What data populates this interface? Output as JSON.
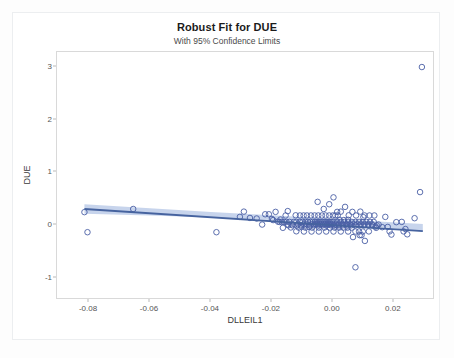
{
  "figure": {
    "title": "Robust Fit for DUE",
    "subtitle": "With 95% Confidence Limits"
  },
  "chart_data": {
    "type": "scatter",
    "title": "Robust Fit for DUE",
    "subtitle": "With 95% Confidence Limits",
    "xlabel": "DLLEIL1",
    "ylabel": "DUE",
    "xlim": [
      -0.0905,
      0.0335
    ],
    "ylim": [
      -1.42,
      3.28
    ],
    "xticks": [
      -0.08,
      -0.06,
      -0.04,
      -0.02,
      0.0,
      0.02
    ],
    "xticklabels": [
      "-0.08",
      "-0.06",
      "-0.04",
      "-0.02",
      "0.00",
      "0.02"
    ],
    "yticks": [
      -1,
      0,
      1,
      2,
      3
    ],
    "yticklabels": [
      "-1",
      "0",
      "1",
      "2",
      "3"
    ],
    "grid": false,
    "legend": false,
    "marker": {
      "shape": "open-circle",
      "color": "#4a5fa5",
      "size": 4
    },
    "fit_line": {
      "name": "Robust fit",
      "color": "#46639f",
      "x": [
        -0.0815,
        0.0295
      ],
      "y": [
        0.305,
        -0.115
      ]
    },
    "confidence_band": {
      "name": "95% Confidence Limits",
      "level": 0.95,
      "color": "#b4c6e6",
      "x": [
        -0.0815,
        -0.06,
        -0.04,
        -0.02,
        0.0,
        0.015,
        0.0295
      ],
      "upper": [
        0.395,
        0.318,
        0.25,
        0.186,
        0.122,
        0.07,
        0.018
      ],
      "lower": [
        0.215,
        0.18,
        0.142,
        0.098,
        0.04,
        -0.03,
        -0.12
      ]
    },
    "points": [
      [
        -0.0815,
        0.245
      ],
      [
        -0.0805,
        -0.135
      ],
      [
        -0.0655,
        0.305
      ],
      [
        -0.0382,
        -0.135
      ],
      [
        -0.0305,
        0.155
      ],
      [
        -0.0292,
        0.255
      ],
      [
        -0.0272,
        0.135
      ],
      [
        -0.025,
        0.125
      ],
      [
        -0.0232,
        0.01
      ],
      [
        -0.0222,
        0.205
      ],
      [
        -0.021,
        0.205
      ],
      [
        -0.02,
        0.115
      ],
      [
        -0.0196,
        0.095
      ],
      [
        -0.0188,
        0.25
      ],
      [
        -0.018,
        0.065
      ],
      [
        -0.0175,
        0.06
      ],
      [
        -0.0168,
        0.06
      ],
      [
        -0.016,
        0.06
      ],
      [
        -0.0152,
        0.06
      ],
      [
        -0.0148,
        0.01
      ],
      [
        -0.0142,
        0.06
      ],
      [
        -0.0135,
        0.015
      ],
      [
        -0.0128,
        0.06
      ],
      [
        -0.012,
        0.06
      ],
      [
        -0.0114,
        0.015
      ],
      [
        -0.0108,
        0.06
      ],
      [
        -0.0104,
        -0.03
      ],
      [
        -0.01,
        0.06
      ],
      [
        -0.0095,
        0.015
      ],
      [
        -0.009,
        0.06
      ],
      [
        -0.0086,
        0.015
      ],
      [
        -0.0082,
        0.06
      ],
      [
        -0.0078,
        -0.035
      ],
      [
        -0.0074,
        0.06
      ],
      [
        -0.007,
        0.015
      ],
      [
        -0.0066,
        0.06
      ],
      [
        -0.0062,
        0.015
      ],
      [
        -0.0058,
        0.06
      ],
      [
        -0.0055,
        0.015
      ],
      [
        -0.0052,
        0.06
      ],
      [
        -0.0049,
        0.015
      ],
      [
        -0.0046,
        0.06
      ],
      [
        -0.0043,
        0.015
      ],
      [
        -0.004,
        0.06
      ],
      [
        -0.0037,
        0.015
      ],
      [
        -0.0034,
        0.06
      ],
      [
        -0.0031,
        0.015
      ],
      [
        -0.0028,
        0.06
      ],
      [
        -0.0025,
        0.015
      ],
      [
        -0.0022,
        0.06
      ],
      [
        -0.0019,
        0.015
      ],
      [
        -0.0016,
        0.06
      ],
      [
        -0.0013,
        0.015
      ],
      [
        -0.001,
        0.06
      ],
      [
        -0.0007,
        0.015
      ],
      [
        -0.0004,
        0.06
      ],
      [
        -0.0001,
        0.015
      ],
      [
        -0.0148,
        0.265
      ],
      [
        -0.0122,
        0.185
      ],
      [
        -0.0108,
        0.182
      ],
      [
        -0.0096,
        0.182
      ],
      [
        -0.0085,
        0.182
      ],
      [
        -0.0072,
        0.182
      ],
      [
        -0.006,
        0.182
      ],
      [
        -0.0048,
        0.182
      ],
      [
        -0.0036,
        0.182
      ],
      [
        -0.0024,
        0.182
      ],
      [
        -0.0012,
        0.182
      ],
      [
        0.0,
        0.182
      ],
      [
        0.0008,
        0.182
      ],
      [
        0.0016,
        0.182
      ],
      [
        -0.0138,
        -0.045
      ],
      [
        -0.0112,
        -0.048
      ],
      [
        -0.009,
        -0.048
      ],
      [
        -0.0068,
        -0.048
      ],
      [
        -0.0046,
        -0.048
      ],
      [
        -0.0028,
        -0.048
      ],
      [
        -0.001,
        -0.048
      ],
      [
        0.0006,
        -0.048
      ],
      [
        0.002,
        -0.048
      ],
      [
        0.0034,
        -0.048
      ],
      [
        0.0048,
        -0.048
      ],
      [
        0.0062,
        -0.048
      ],
      [
        -0.012,
        -0.118
      ],
      [
        -0.0095,
        -0.122
      ],
      [
        -0.007,
        -0.122
      ],
      [
        -0.0046,
        -0.122
      ],
      [
        -0.0022,
        -0.122
      ],
      [
        0.0002,
        -0.122
      ],
      [
        0.0026,
        -0.122
      ],
      [
        0.005,
        -0.122
      ],
      [
        0.0074,
        -0.122
      ],
      [
        -0.005,
        0.44
      ],
      [
        -0.003,
        0.305
      ],
      [
        -0.0012,
        0.395
      ],
      [
        0.0002,
        0.525
      ],
      [
        0.0014,
        0.25
      ],
      [
        0.0026,
        0.255
      ],
      [
        0.004,
        0.345
      ],
      [
        0.0052,
        0.185
      ],
      [
        0.0064,
        0.25
      ],
      [
        0.0076,
        0.182
      ],
      [
        0.009,
        0.255
      ],
      [
        0.01,
        0.15
      ],
      [
        0.0002,
        0.06
      ],
      [
        0.0008,
        0.015
      ],
      [
        0.0014,
        0.06
      ],
      [
        0.002,
        0.015
      ],
      [
        0.0026,
        0.06
      ],
      [
        0.0032,
        0.015
      ],
      [
        0.0038,
        0.06
      ],
      [
        0.0044,
        0.015
      ],
      [
        0.005,
        0.06
      ],
      [
        0.0056,
        0.015
      ],
      [
        0.0062,
        0.06
      ],
      [
        0.0068,
        0.015
      ],
      [
        0.0074,
        0.06
      ],
      [
        0.008,
        0.015
      ],
      [
        0.0086,
        0.06
      ],
      [
        0.0092,
        0.015
      ],
      [
        0.0098,
        0.06
      ],
      [
        0.0104,
        0.015
      ],
      [
        0.011,
        0.06
      ],
      [
        0.0116,
        0.015
      ],
      [
        0.0122,
        0.06
      ],
      [
        0.0128,
        0.015
      ],
      [
        0.0134,
        0.06
      ],
      [
        0.014,
        -0.03
      ],
      [
        0.0088,
        -0.192
      ],
      [
        0.0094,
        -0.19
      ],
      [
        0.0066,
        -0.228
      ],
      [
        0.0142,
        -0.052
      ],
      [
        0.015,
        0.01
      ],
      [
        0.0162,
        -0.04
      ],
      [
        0.0172,
        0.155
      ],
      [
        0.018,
        -0.035
      ],
      [
        0.0186,
        -0.12
      ],
      [
        0.0192,
        -0.18
      ],
      [
        0.0074,
        -0.8
      ],
      [
        0.0105,
        -0.3
      ],
      [
        0.0208,
        0.055
      ],
      [
        0.0226,
        0.06
      ],
      [
        0.0238,
        -0.075
      ],
      [
        0.0232,
        -0.12
      ],
      [
        0.0244,
        -0.175
      ],
      [
        0.0268,
        0.13
      ],
      [
        0.0286,
        0.625
      ],
      [
        0.0292,
        2.995
      ],
      [
        0.005,
        0.1
      ],
      [
        0.0036,
        0.095
      ],
      [
        0.0022,
        0.1
      ],
      [
        0.0012,
        -0.005
      ],
      [
        -0.0006,
        -0.005
      ],
      [
        -0.002,
        -0.005
      ],
      [
        -0.0034,
        -0.005
      ],
      [
        -0.0048,
        -0.005
      ],
      [
        -0.0062,
        -0.005
      ],
      [
        -0.0076,
        -0.005
      ],
      [
        -0.009,
        -0.005
      ],
      [
        -0.0104,
        -0.005
      ],
      [
        -0.0118,
        -0.005
      ],
      [
        -0.0132,
        -0.005
      ],
      [
        -0.0146,
        -0.005
      ],
      [
        0.0004,
        -0.005
      ],
      [
        0.0018,
        -0.005
      ],
      [
        0.0032,
        -0.005
      ],
      [
        0.0046,
        -0.005
      ],
      [
        0.006,
        -0.005
      ],
      [
        0.0074,
        -0.005
      ],
      [
        0.0088,
        -0.005
      ],
      [
        0.0102,
        -0.005
      ],
      [
        0.0116,
        -0.005
      ],
      [
        0.013,
        -0.005
      ],
      [
        0.0144,
        -0.005
      ],
      [
        0.0136,
        0.182
      ],
      [
        0.012,
        0.182
      ],
      [
        0.0104,
        0.182
      ],
      [
        -0.0164,
        -0.052
      ],
      [
        -0.0155,
        0.182
      ],
      [
        -0.0172,
        0.105
      ],
      [
        0.0118,
        -0.12
      ],
      [
        0.0098,
        -0.122
      ],
      [
        0.0086,
        -0.122
      ]
    ]
  }
}
